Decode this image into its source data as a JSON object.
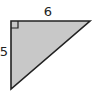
{
  "diagram": {
    "type": "right-triangle",
    "fill_color": "#c8c8c8",
    "stroke_color": "#222222",
    "right_angle_marker": true,
    "labels": {
      "top_side": "6",
      "left_side": "5"
    }
  }
}
